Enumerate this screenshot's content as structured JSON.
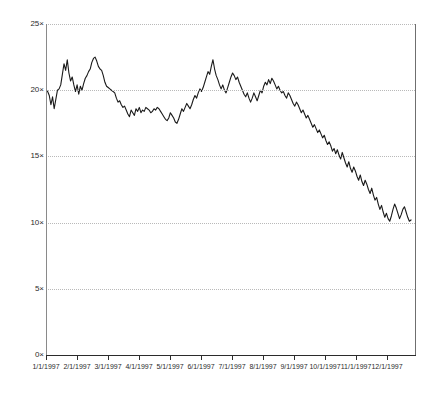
{
  "chart_data": {
    "type": "line",
    "title": "",
    "subtitle": "",
    "xlabel": "",
    "ylabel": "",
    "grid": true,
    "legend": null,
    "ylim": [
      0,
      25
    ],
    "y_ticks": [
      0,
      5,
      10,
      15,
      20,
      25
    ],
    "y_tick_labels": [
      "0×",
      "5×",
      "10×",
      "15×",
      "20×",
      "25×"
    ],
    "x_tick_labels": [
      "1/1/1997",
      "2/1/1997",
      "3/1/1997",
      "4/1/1997",
      "5/1/1997",
      "6/1/1997",
      "7/1/1997",
      "8/1/1997",
      "9/1/1997",
      "10/1/1997",
      "11/1/1997",
      "12/1/1997"
    ],
    "xlim": [
      "1/1/1997",
      "12/31/1997"
    ],
    "series": [
      {
        "name": "",
        "color": "#1a1a1a",
        "values": [
          20.0,
          19.9,
          19.6,
          18.9,
          19.5,
          18.6,
          19.3,
          20.0,
          20.1,
          20.4,
          21.2,
          22.0,
          21.5,
          22.3,
          21.3,
          20.7,
          21.0,
          20.4,
          19.9,
          20.4,
          19.7,
          20.3,
          20.0,
          20.5,
          20.9,
          21.1,
          21.4,
          21.6,
          22.1,
          22.4,
          22.5,
          22.2,
          21.8,
          21.6,
          21.5,
          21.1,
          20.6,
          20.3,
          20.2,
          20.1,
          20.0,
          19.9,
          19.8,
          19.4,
          19.1,
          19.2,
          18.9,
          18.7,
          18.8,
          18.5,
          18.2,
          18.0,
          18.5,
          18.3,
          18.1,
          18.6,
          18.4,
          18.7,
          18.3,
          18.5,
          18.4,
          18.7,
          18.6,
          18.5,
          18.3,
          18.4,
          18.6,
          18.5,
          18.7,
          18.6,
          18.4,
          18.2,
          18.0,
          17.8,
          17.7,
          17.9,
          18.3,
          18.1,
          17.9,
          17.6,
          17.5,
          17.8,
          18.2,
          18.6,
          18.4,
          18.7,
          19.0,
          18.8,
          18.6,
          18.9,
          19.3,
          19.6,
          19.4,
          19.8,
          20.1,
          19.9,
          20.2,
          20.6,
          21.0,
          21.4,
          21.2,
          21.8,
          22.3,
          21.6,
          21.1,
          20.8,
          20.4,
          20.1,
          20.4,
          20.0,
          19.8,
          20.2,
          20.6,
          21.0,
          21.3,
          21.1,
          20.8,
          21.0,
          20.6,
          20.3,
          20.0,
          19.7,
          19.5,
          19.8,
          19.4,
          19.1,
          19.4,
          19.8,
          19.5,
          19.2,
          19.6,
          20.0,
          19.8,
          20.3,
          20.6,
          20.4,
          20.8,
          20.5,
          20.9,
          20.7,
          20.4,
          20.1,
          20.3,
          20.0,
          19.8,
          19.9,
          19.6,
          19.4,
          19.8,
          19.6,
          19.3,
          19.0,
          18.8,
          19.1,
          18.9,
          18.6,
          18.3,
          18.5,
          18.2,
          17.9,
          18.1,
          17.8,
          17.5,
          17.2,
          17.4,
          17.1,
          16.8,
          17.0,
          16.7,
          16.4,
          16.6,
          16.2,
          15.9,
          16.1,
          15.8,
          15.4,
          15.6,
          15.2,
          15.5,
          15.1,
          14.8,
          15.3,
          14.9,
          14.5,
          14.2,
          14.6,
          14.1,
          13.8,
          14.2,
          13.9,
          13.5,
          13.2,
          13.6,
          13.1,
          12.8,
          13.2,
          12.9,
          12.5,
          12.2,
          12.6,
          12.1,
          11.7,
          11.9,
          11.4,
          11.0,
          11.3,
          10.8,
          10.4,
          10.7,
          10.3,
          10.1,
          10.5,
          11.0,
          11.4,
          11.1,
          10.7,
          10.3,
          10.6,
          11.0,
          11.2,
          10.8,
          10.4,
          10.1,
          10.2
        ]
      }
    ]
  },
  "axes": {
    "y_axis_color": "#8a8a8a",
    "x_axis_color": "#2b2b2b",
    "gridline_color": "#b9b9b9",
    "line_color": "#1a1a1a",
    "background": "#ffffff"
  }
}
